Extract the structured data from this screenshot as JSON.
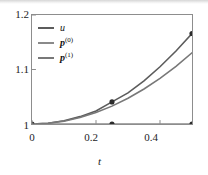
{
  "chart_data": {
    "type": "line",
    "title": "",
    "xlabel": "t",
    "ylabel": "",
    "xlim": [
      0,
      0.5
    ],
    "ylim": [
      1,
      1.2
    ],
    "xticks": [
      "0",
      "0.2",
      "0.4"
    ],
    "xtick_values": [
      0,
      0.2,
      0.4
    ],
    "yticks": [
      "1.2",
      "1.1",
      "1"
    ],
    "ytick_values": [
      1.2,
      1.1,
      1.0
    ],
    "grid": false,
    "legend_position": "upper-left",
    "series": [
      {
        "name": "u",
        "label_html": "u",
        "color": "#5c5c5c",
        "x": [
          0,
          0.05,
          0.1,
          0.15,
          0.2,
          0.25,
          0.3,
          0.35,
          0.4,
          0.45,
          0.5
        ],
        "values": [
          1.0,
          1.0015,
          1.006,
          1.0135,
          1.024,
          1.0405,
          1.057,
          1.079,
          1.105,
          1.134,
          1.166
        ]
      },
      {
        "name": "p0",
        "label_html": "p(0)",
        "color": "#8a8a8a",
        "x": [
          0,
          0.05,
          0.1,
          0.15,
          0.2,
          0.25,
          0.3,
          0.35,
          0.4,
          0.45,
          0.5
        ],
        "values": [
          1.0,
          1.0,
          1.0,
          1.0,
          1.0,
          1.0,
          1.0,
          1.0,
          1.0,
          1.0,
          1.0
        ]
      },
      {
        "name": "p1",
        "label_html": "p(1)",
        "color": "#787878",
        "x": [
          0,
          0.05,
          0.1,
          0.15,
          0.2,
          0.25,
          0.3,
          0.35,
          0.4,
          0.45,
          0.5
        ],
        "values": [
          1.0,
          1.0013,
          1.0052,
          1.0118,
          1.021,
          1.0328,
          1.0472,
          1.0642,
          1.0838,
          1.1059,
          1.1306
        ]
      }
    ],
    "markers": [
      {
        "x": 0,
        "y": 1.0
      },
      {
        "x": 0.25,
        "y": 1.0
      },
      {
        "x": 0.5,
        "y": 1.0
      },
      {
        "x": 0.25,
        "y": 1.0405
      },
      {
        "x": 0.5,
        "y": 1.166
      }
    ],
    "marker_color": "#2b2b2b"
  },
  "legend": {
    "items": [
      {
        "label": "u",
        "superscript": "",
        "bold": false
      },
      {
        "label": "p",
        "superscript": "(0)",
        "bold": true
      },
      {
        "label": "p",
        "superscript": "(1)",
        "bold": true
      }
    ]
  },
  "axes": {
    "x_label": "t",
    "x_ticks": [
      "0",
      "0.2",
      "0.4"
    ],
    "y_ticks": [
      "1.2",
      "1.1",
      "1"
    ]
  },
  "colors": {
    "frame": "#8d8d8d",
    "text": "#1d1d1d",
    "series_u": "#5c5c5c",
    "series_p0": "#8a8a8a",
    "series_p1": "#787878",
    "marker": "#2b2b2b",
    "background": "#ffffff"
  }
}
